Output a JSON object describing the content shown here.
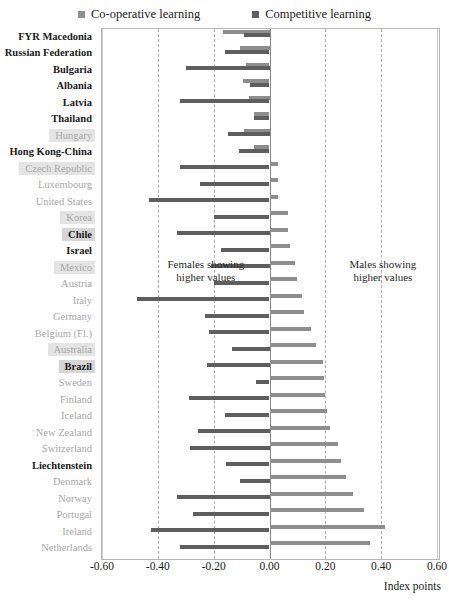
{
  "legend": {
    "items": [
      {
        "label": "Co-operative learning",
        "color": "#8e8e8e",
        "key": "coop"
      },
      {
        "label": "Competitive learning",
        "color": "#5e5e5e",
        "key": "comp"
      }
    ]
  },
  "annotations": {
    "left": "Females showing\nhigher values",
    "left_line1": "Females showing",
    "left_line2": "higher values",
    "right_line1": "Males showing",
    "right_line2": "higher values"
  },
  "axis": {
    "title": "Index points",
    "ticks": [
      "-0.60",
      "-0.40",
      "-0.20",
      "0.00",
      "0.20",
      "0.40",
      "0.60"
    ],
    "tick_values": [
      -0.6,
      -0.4,
      -0.2,
      0.0,
      0.2,
      0.4,
      0.6
    ]
  },
  "chart_data": {
    "type": "bar",
    "orientation": "horizontal",
    "title": "",
    "xlabel": "Index points",
    "ylabel": "",
    "xlim": [
      -0.6,
      0.6
    ],
    "grid": true,
    "legend_position": "top",
    "categories": [
      "FYR Macedonia",
      "Russian Federation",
      "Bulgaria",
      "Albania",
      "Latvia",
      "Thailand",
      "Hungary",
      "Hong Kong-China",
      "Czech Republic",
      "Luxembourg",
      "United States",
      "Korea",
      "Chile",
      "Israel",
      "Mexico",
      "Austria",
      "Italy",
      "Germany",
      "Belgium (Fl.)",
      "Australia",
      "Brazil",
      "Sweden",
      "Finland",
      "Iceland",
      "New Zealand",
      "Switzerland",
      "Liechtenstein",
      "Denmark",
      "Norway",
      "Portugal",
      "Ireland",
      "Netherlands"
    ],
    "series": [
      {
        "name": "Co-operative learning",
        "color": "#8e8e8e",
        "values": [
          -0.165,
          -0.105,
          -0.085,
          -0.095,
          -0.075,
          -0.055,
          -0.09,
          -0.055,
          0.03,
          0.03,
          0.03,
          0.065,
          0.065,
          0.075,
          0.09,
          0.1,
          0.115,
          0.125,
          0.15,
          0.165,
          0.19,
          0.195,
          0.2,
          0.205,
          0.215,
          0.245,
          0.255,
          0.275,
          0.3,
          0.34,
          0.415,
          0.36
        ]
      },
      {
        "name": "Competitive learning",
        "color": "#5e5e5e",
        "values": [
          -0.09,
          -0.16,
          -0.3,
          -0.07,
          -0.32,
          -0.055,
          -0.15,
          -0.11,
          -0.32,
          -0.25,
          -0.43,
          -0.2,
          -0.33,
          -0.175,
          -0.21,
          -0.2,
          -0.475,
          -0.23,
          -0.215,
          -0.135,
          -0.225,
          -0.05,
          -0.29,
          -0.16,
          -0.255,
          -0.285,
          -0.155,
          -0.105,
          -0.33,
          -0.275,
          -0.425,
          -0.32
        ]
      }
    ],
    "label_styles": [
      "dark",
      "dark",
      "dark",
      "dark",
      "dark",
      "dark",
      "light-hl",
      "dark",
      "light-hl",
      "light",
      "light",
      "light-hl",
      "dark-hl",
      "dark",
      "light-hl",
      "light",
      "light",
      "light",
      "light",
      "light-hl",
      "dark-hl",
      "light",
      "light",
      "light",
      "light",
      "light",
      "dark",
      "light",
      "light",
      "light",
      "light",
      "light"
    ]
  }
}
